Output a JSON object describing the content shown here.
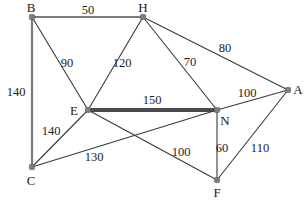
{
  "figure": {
    "width": 308,
    "height": 201,
    "background_color": "#ffffff",
    "edge_color": "#6b6b6b",
    "node_color": "#7d7d7d",
    "label_color": "#1b1b1b",
    "highlight_color": "#4a4a4a"
  },
  "chart_data": {
    "type": "diagram",
    "graph_type": "weighted-undirected-graph",
    "title": "",
    "nodes": [
      {
        "id": "B",
        "label": "B",
        "x": 32,
        "y": 17,
        "label_x": 31,
        "label_y": 7
      },
      {
        "id": "H",
        "label": "H",
        "x": 143,
        "y": 17,
        "label_x": 143,
        "label_y": 7
      },
      {
        "id": "A",
        "label": "A",
        "x": 288,
        "y": 90,
        "label_x": 298,
        "label_y": 89
      },
      {
        "id": "E",
        "label": "E",
        "x": 88,
        "y": 110,
        "label_x": 74,
        "label_y": 110
      },
      {
        "id": "N",
        "label": "N",
        "x": 217,
        "y": 110,
        "label_x": 225,
        "label_y": 120
      },
      {
        "id": "C",
        "label": "C",
        "x": 32,
        "y": 167,
        "label_x": 31,
        "label_y": 180
      },
      {
        "id": "F",
        "label": "F",
        "x": 217,
        "y": 180,
        "label_x": 217,
        "label_y": 192
      }
    ],
    "edges": [
      {
        "source": "B",
        "target": "H",
        "weight": 50,
        "label_x": 88,
        "label_y": 10,
        "style": "medium"
      },
      {
        "source": "B",
        "target": "C",
        "weight": 140,
        "label_x": 16,
        "label_y": 92,
        "style": "medium"
      },
      {
        "source": "B",
        "target": "E",
        "weight": 90,
        "label_x": 67,
        "label_y": 63,
        "style": "thin"
      },
      {
        "source": "H",
        "target": "E",
        "weight": 120,
        "label_x": 122,
        "label_y": 63,
        "style": "thin"
      },
      {
        "source": "H",
        "target": "N",
        "weight": 70,
        "label_x": 190,
        "label_y": 62,
        "style": "thin"
      },
      {
        "source": "H",
        "target": "A",
        "weight": 80,
        "label_x": 225,
        "label_y": 48,
        "style": "thin"
      },
      {
        "source": "E",
        "target": "N",
        "weight": 150,
        "label_x": 152,
        "label_y": 100,
        "style": "bold"
      },
      {
        "source": "E",
        "target": "C",
        "weight": 140,
        "label_x": 51,
        "label_y": 131,
        "style": "thin"
      },
      {
        "source": "E",
        "target": "F",
        "weight": 100,
        "label_x": 181,
        "label_y": 152,
        "style": "thin"
      },
      {
        "source": "C",
        "target": "N",
        "weight": 130,
        "label_x": 94,
        "label_y": 157,
        "style": "thin"
      },
      {
        "source": "N",
        "target": "A",
        "weight": 100,
        "label_x": 247,
        "label_y": 93,
        "style": "thin"
      },
      {
        "source": "N",
        "target": "F",
        "weight": 60,
        "label_x": 222,
        "label_y": 148,
        "style": "thin"
      },
      {
        "source": "F",
        "target": "A",
        "weight": 110,
        "label_x": 260,
        "label_y": 148,
        "style": "thin"
      }
    ],
    "highlighted_edges": [
      "E-N"
    ],
    "node_count": 7,
    "edge_count": 13
  }
}
